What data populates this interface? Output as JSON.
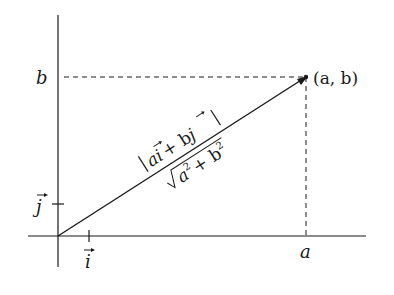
{
  "diagram": {
    "type": "vector-magnitude",
    "labels": {
      "y_tick": "b",
      "x_tick": "a",
      "point": "(a, b)",
      "unit_j": "j",
      "unit_i": "i",
      "magnitude_top": "|ai + bj|",
      "magnitude_top_a": "a",
      "magnitude_top_i": "i",
      "magnitude_top_plus": "+ b",
      "magnitude_top_j": "j",
      "magnitude_bottom_a": "a",
      "magnitude_bottom_plus": "+ b",
      "exp": "2"
    },
    "colors": {
      "ink": "#1a1a1a",
      "background": "#ffffff"
    }
  }
}
